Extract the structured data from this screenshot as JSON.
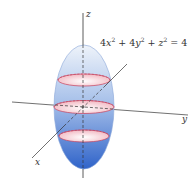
{
  "figure": {
    "equation": {
      "display": "4x² + 4y² + z² = 4",
      "parts": {
        "c1": "4",
        "v1": "x",
        "e1": "2",
        "plus1": " + ",
        "c2": "4",
        "v2": "y",
        "e2": "2",
        "plus2": " + ",
        "v3": "z",
        "e3": "2",
        "rhs": " = 4"
      }
    },
    "axes": {
      "x_label": "x",
      "y_label": "y",
      "z_label": "z"
    },
    "cross_sections": [
      "top",
      "middle",
      "bottom"
    ],
    "colors": {
      "ellipsoid_top": "#e6eef8",
      "ellipsoid_bottom": "#3a6fd0",
      "ellipsoid_edge": "#8aa6d8",
      "disk_fill": "#f6d3d8",
      "disk_edge": "#c8405a",
      "axis": "#333333"
    }
  }
}
